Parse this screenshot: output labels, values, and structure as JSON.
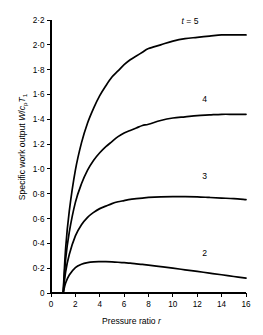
{
  "chart_data": {
    "type": "line",
    "title": "",
    "xlabel": "Pressure ratio r",
    "xlabel_parts": {
      "text": "Pressure ratio ",
      "symbol": "r"
    },
    "ylabel": "Specific work output W/c_p T_1",
    "ylabel_parts": {
      "prefix": "Specific work output ",
      "w": "W",
      "slash": "/",
      "c": "c",
      "c_sub": "p",
      "t": "T",
      "t_sub": "1"
    },
    "xlim": [
      0,
      16
    ],
    "ylim": [
      0,
      2.2
    ],
    "xticks": [
      0,
      2,
      4,
      6,
      8,
      10,
      12,
      14,
      16
    ],
    "xtick_labels": [
      "0",
      "2",
      "4",
      "6",
      "8",
      "10",
      "12",
      "14",
      "16"
    ],
    "yticks": [
      0,
      0.2,
      0.4,
      0.6,
      0.8,
      1.0,
      1.2,
      1.4,
      1.6,
      1.8,
      2.0,
      2.2
    ],
    "ytick_labels": [
      "0",
      "0·2",
      "0·4",
      "0·6",
      "0·8",
      "1·0",
      "1·2",
      "1·4",
      "1·6",
      "1·8",
      "2·0",
      "2·2"
    ],
    "grid": false,
    "legend_position": "inline-curve-labels",
    "line_color": "#000000",
    "background_color": "#ffffff",
    "series": [
      {
        "name": "t = 5",
        "label_text": "t = 5",
        "label_italic_prefix": "t",
        "label_rest": " = 5",
        "label_x": 11.4,
        "label_y": 2.17,
        "x": [
          1.0,
          1.2,
          1.5,
          2.0,
          2.5,
          3.0,
          3.5,
          4.0,
          4.5,
          5.0,
          5.5,
          6.0,
          6.5,
          7.0,
          7.5,
          8.0,
          9.0,
          10.0,
          11.0,
          12.0,
          13.0,
          14.0,
          15.0,
          16.0
        ],
        "y": [
          0.0,
          0.36,
          0.66,
          0.99,
          1.21,
          1.37,
          1.49,
          1.59,
          1.67,
          1.74,
          1.79,
          1.84,
          1.88,
          1.91,
          1.94,
          1.97,
          2.0,
          2.03,
          2.05,
          2.06,
          2.07,
          2.08,
          2.08,
          2.08
        ]
      },
      {
        "name": "4",
        "label_text": "4",
        "label_x": 12.6,
        "label_y": 1.54,
        "x": [
          1.0,
          1.2,
          1.5,
          2.0,
          2.5,
          3.0,
          3.5,
          4.0,
          4.5,
          5.0,
          5.5,
          6.0,
          6.5,
          7.0,
          7.5,
          8.0,
          9.0,
          10.0,
          11.0,
          12.0,
          13.0,
          14.0,
          15.0,
          16.0
        ],
        "y": [
          0.0,
          0.27,
          0.49,
          0.73,
          0.88,
          0.99,
          1.07,
          1.13,
          1.18,
          1.22,
          1.26,
          1.29,
          1.31,
          1.33,
          1.35,
          1.36,
          1.39,
          1.41,
          1.42,
          1.43,
          1.435,
          1.44,
          1.44,
          1.44
        ]
      },
      {
        "name": "3",
        "label_text": "3",
        "label_x": 12.6,
        "label_y": 0.92,
        "x": [
          1.0,
          1.2,
          1.5,
          2.0,
          2.5,
          3.0,
          3.5,
          4.0,
          4.5,
          5.0,
          5.5,
          6.0,
          6.5,
          7.0,
          7.5,
          8.0,
          9.0,
          10.0,
          11.0,
          12.0,
          13.0,
          14.0,
          15.0,
          16.0
        ],
        "y": [
          0.0,
          0.17,
          0.31,
          0.46,
          0.55,
          0.61,
          0.65,
          0.68,
          0.7,
          0.72,
          0.735,
          0.745,
          0.755,
          0.76,
          0.765,
          0.77,
          0.775,
          0.777,
          0.777,
          0.775,
          0.77,
          0.765,
          0.76,
          0.752
        ]
      },
      {
        "name": "2",
        "label_text": "2",
        "label_x": 12.6,
        "label_y": 0.3,
        "x": [
          1.0,
          1.2,
          1.5,
          2.0,
          2.5,
          3.0,
          3.5,
          4.0,
          4.5,
          5.0,
          5.5,
          6.0,
          6.5,
          7.0,
          7.5,
          8.0,
          9.0,
          10.0,
          11.0,
          12.0,
          13.0,
          14.0,
          15.0,
          16.0
        ],
        "y": [
          0.0,
          0.08,
          0.145,
          0.205,
          0.232,
          0.245,
          0.251,
          0.2525,
          0.2525,
          0.251,
          0.248,
          0.244,
          0.24,
          0.235,
          0.23,
          0.224,
          0.212,
          0.2,
          0.187,
          0.174,
          0.16,
          0.147,
          0.133,
          0.12
        ]
      }
    ]
  }
}
